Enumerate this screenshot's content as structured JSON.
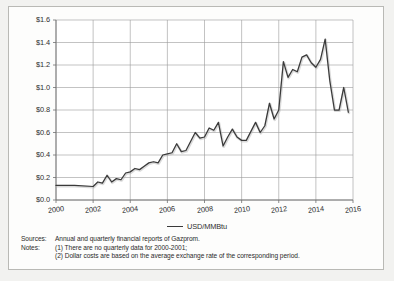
{
  "chart_data": {
    "type": "line",
    "title": "",
    "xlabel": "",
    "ylabel": "",
    "xlim": [
      2000,
      2016
    ],
    "ylim": [
      0.0,
      1.6
    ],
    "grid": true,
    "legend_position": "bottom-center",
    "y_ticks": [
      "$0.0",
      "$0.2",
      "$0.4",
      "$0.6",
      "$0.8",
      "$1.0",
      "$1.2",
      "$1.4",
      "$1.6"
    ],
    "y_tick_values": [
      0.0,
      0.2,
      0.4,
      0.6,
      0.8,
      1.0,
      1.2,
      1.4,
      1.6
    ],
    "x_ticks": [
      "2000",
      "2002",
      "2004",
      "2006",
      "2008",
      "2010",
      "2012",
      "2014",
      "2016"
    ],
    "x_tick_values": [
      2000,
      2002,
      2004,
      2006,
      2008,
      2010,
      2012,
      2014,
      2016
    ],
    "series": [
      {
        "name": "USD/MMBtu",
        "color": "#3a3a3a",
        "x": [
          2000.0,
          2001.0,
          2002.0,
          2002.25,
          2002.5,
          2002.75,
          2003.0,
          2003.25,
          2003.5,
          2003.75,
          2004.0,
          2004.25,
          2004.5,
          2004.75,
          2005.0,
          2005.25,
          2005.5,
          2005.75,
          2006.0,
          2006.25,
          2006.5,
          2006.75,
          2007.0,
          2007.25,
          2007.5,
          2007.75,
          2008.0,
          2008.25,
          2008.5,
          2008.75,
          2009.0,
          2009.25,
          2009.5,
          2009.75,
          2010.0,
          2010.25,
          2010.5,
          2010.75,
          2011.0,
          2011.25,
          2011.5,
          2011.75,
          2012.0,
          2012.25,
          2012.5,
          2012.75,
          2013.0,
          2013.25,
          2013.5,
          2013.75,
          2014.0,
          2014.25,
          2014.5,
          2014.75,
          2015.0,
          2015.25,
          2015.5,
          2015.75
        ],
        "y": [
          0.13,
          0.13,
          0.12,
          0.16,
          0.15,
          0.22,
          0.16,
          0.19,
          0.18,
          0.24,
          0.25,
          0.28,
          0.27,
          0.3,
          0.33,
          0.34,
          0.33,
          0.4,
          0.41,
          0.42,
          0.5,
          0.43,
          0.44,
          0.52,
          0.6,
          0.55,
          0.56,
          0.64,
          0.62,
          0.69,
          0.48,
          0.56,
          0.63,
          0.56,
          0.53,
          0.53,
          0.61,
          0.69,
          0.6,
          0.66,
          0.86,
          0.72,
          0.8,
          1.23,
          1.09,
          1.16,
          1.14,
          1.27,
          1.29,
          1.22,
          1.18,
          1.25,
          1.43,
          1.06,
          0.8,
          0.8,
          1.0,
          0.78
        ]
      }
    ]
  },
  "legend": {
    "label": "USD/MMBtu"
  },
  "notes": [
    {
      "key": "Sources:",
      "value": "Annual and quarterly financial reports of Gazprom.",
      "indent": false
    },
    {
      "key": "Notes:",
      "value": "(1) There are no quarterly data for 2000-2001;",
      "indent": false
    },
    {
      "key": "",
      "value": "(2) Dollar costs are based on the average exchange rate of the corresponding period.",
      "indent": true
    }
  ]
}
